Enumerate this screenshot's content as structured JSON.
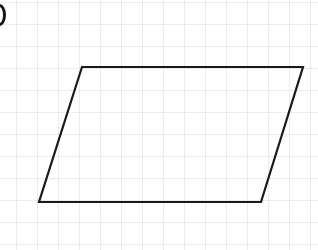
{
  "canvas": {
    "width": 318,
    "height": 250,
    "background_color": "#ffffff"
  },
  "grid": {
    "line_color": "#d9d9d9",
    "line_width": 1,
    "cell_width": 21,
    "cell_height": 22,
    "origin_x": 16,
    "origin_y": 2,
    "columns": 15,
    "rows": 12
  },
  "figure": {
    "name": "parallelogram",
    "stroke_color": "#1a1a1a",
    "stroke_width": 2.2,
    "fill": "none",
    "points": "82,67 303,67 261,202 39,202",
    "vertices": [
      {
        "label": "top-left",
        "x": 82,
        "y": 67
      },
      {
        "label": "top-right",
        "x": 303,
        "y": 67
      },
      {
        "label": "bottom-right",
        "x": 261,
        "y": 202
      },
      {
        "label": "bottom-left",
        "x": 39,
        "y": 202
      }
    ],
    "edges": [
      {
        "label": "top-edge",
        "from": "top-left",
        "to": "top-right",
        "grid_units": 10.5
      },
      {
        "label": "right-edge",
        "from": "top-right",
        "to": "bottom-right",
        "grid_units": 6.5
      },
      {
        "label": "bottom-edge",
        "from": "bottom-right",
        "to": "bottom-left",
        "grid_units": 10.5
      },
      {
        "label": "left-edge",
        "from": "bottom-left",
        "to": "top-left",
        "grid_units": 6.5
      }
    ]
  },
  "edge_marker": {
    "name": "cropped-label-glyph",
    "color": "#151515",
    "description": "partial dark oval clipped by left border"
  }
}
